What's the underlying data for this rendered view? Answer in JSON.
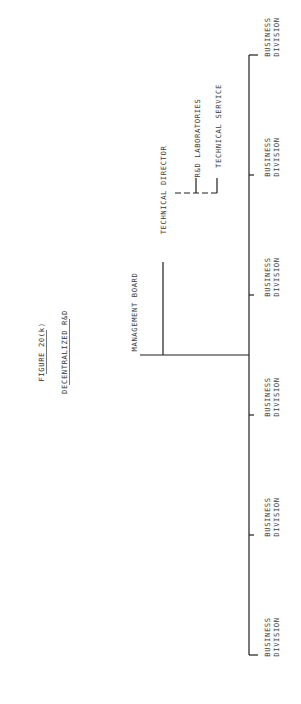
{
  "figure_label": "FIGURE 20(k)",
  "title": "DECENTRALIZED R&D",
  "root": "MANAGEMENT BOARD",
  "staff": {
    "head": "TECHNICAL DIRECTOR",
    "units": [
      "R&D LABORATORIES",
      "TECHNICAL SERVICE"
    ]
  },
  "divisions": [
    {
      "line1": "BUSINESS",
      "line2": "DIVISION"
    },
    {
      "line1": "BUSINESS",
      "line2": "DIVISION"
    },
    {
      "line1": "BUSINESS",
      "line2": "DIVISION"
    },
    {
      "line1": "BUSINESS",
      "line2": "DIVISION"
    },
    {
      "line1": "BUSINESS",
      "line2": "DIVISION"
    },
    {
      "line1": "BUSINESS",
      "line2": "DIVISION"
    }
  ]
}
